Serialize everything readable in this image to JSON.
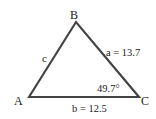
{
  "figure": {
    "type": "triangle",
    "stroke_color": "#444444",
    "vertices": {
      "A": {
        "label": "A",
        "x": 29,
        "y": 97
      },
      "B": {
        "label": "B",
        "x": 76,
        "y": 22
      },
      "C": {
        "label": "C",
        "x": 139,
        "y": 97
      }
    },
    "sides": {
      "a": {
        "label": "a = 13.7"
      },
      "b": {
        "label": "b = 12.5"
      },
      "c": {
        "label": "c"
      }
    },
    "angles": {
      "C": {
        "label": "49.7°"
      }
    }
  }
}
